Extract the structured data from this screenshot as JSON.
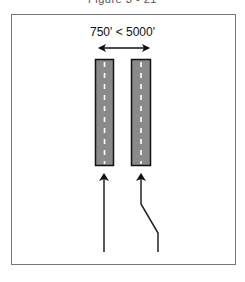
{
  "caption": "Figure 3 - 21",
  "distance_label": "750' < 5000'",
  "colors": {
    "runway_fill": "#8a8a8a",
    "runway_border": "#111111",
    "centerline": "#ffffff",
    "arrow": "#222222",
    "frame": "#777777"
  },
  "runways": [
    {
      "name": "left-runway",
      "x": 95,
      "y": 59,
      "width": 19,
      "height": 107
    },
    {
      "name": "right-runway",
      "x": 131,
      "y": 59,
      "width": 20,
      "height": 107
    }
  ],
  "approach_paths": [
    {
      "name": "straight-approach",
      "points": "104,252 104,174"
    },
    {
      "name": "offset-approach",
      "points": "158,252 158,233 141,204 141,174"
    }
  ]
}
